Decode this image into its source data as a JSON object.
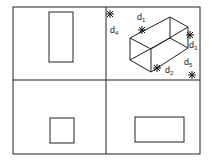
{
  "labels": {
    "d1": {
      "main": "d",
      "sub": "1"
    },
    "d2": {
      "main": "d",
      "sub": "2"
    },
    "d3": {
      "main": "d",
      "sub": "3"
    },
    "d4": {
      "main": "d",
      "sub": "4"
    },
    "d5": {
      "main": "d",
      "sub": "5"
    }
  },
  "panels": [
    "top-left-view",
    "top-right-isometric",
    "bottom-left-view",
    "bottom-right-view"
  ]
}
